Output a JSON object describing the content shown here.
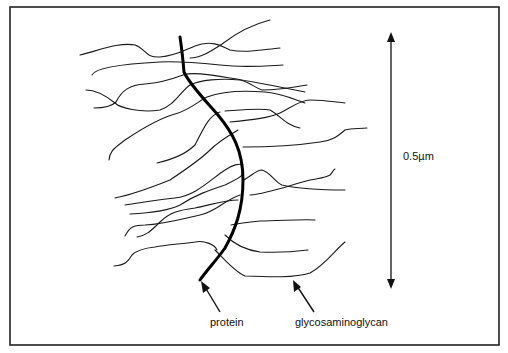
{
  "figure": {
    "type": "proteoglycan schematic",
    "labels": {
      "protein": "protein",
      "glycosaminoglycan": "glycosaminoglycan",
      "scale": "0.5µm"
    },
    "colors": {
      "line": "#1a1a1a",
      "background": "#ffffff",
      "frame": "#222222"
    }
  }
}
